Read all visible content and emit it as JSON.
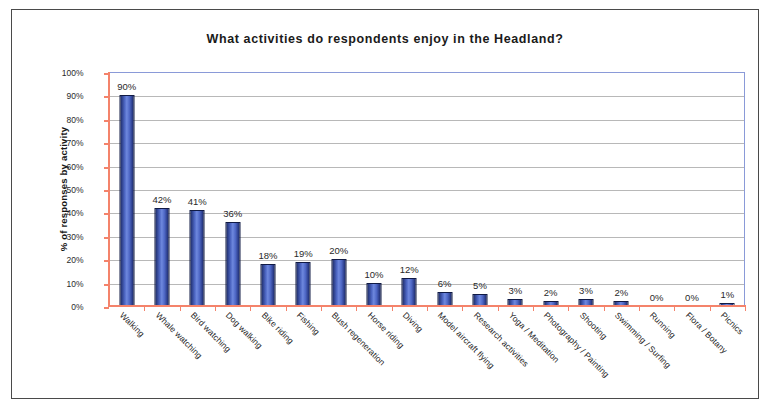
{
  "chart_data": {
    "type": "bar",
    "title": "What activities do respondents enjoy in the Headland?",
    "xlabel": "",
    "ylabel": "% of responses by activity",
    "ylim": [
      0,
      100
    ],
    "ytick_labels": [
      "100%",
      "90%",
      "80%",
      "70%",
      "60%",
      "50%",
      "40%",
      "30%",
      "20%",
      "10%",
      "0%"
    ],
    "ytick_values": [
      100,
      90,
      80,
      70,
      60,
      50,
      40,
      30,
      20,
      10,
      0
    ],
    "grid": true,
    "legend": null,
    "categories": [
      "Walking",
      "Whale watching",
      "Bird watching",
      "Dog walking",
      "Bike riding",
      "Fishing",
      "Bush regeneration",
      "Horse riding",
      "Diving",
      "Model aircraft flying",
      "Research activities",
      "Yoga / Meditation",
      "Photography / Painting",
      "Shooting",
      "Swimming / Surfing",
      "Running",
      "Flora / Botany",
      "Picnics"
    ],
    "values": [
      90,
      42,
      41,
      36,
      18,
      19,
      20,
      10,
      12,
      6,
      5,
      3,
      2,
      3,
      2,
      0,
      0,
      1
    ],
    "data_labels": [
      "90%",
      "42%",
      "41%",
      "36%",
      "18%",
      "19%",
      "20%",
      "10%",
      "12%",
      "6%",
      "5%",
      "3%",
      "2%",
      "3%",
      "2%",
      "0%",
      "0%",
      "1%"
    ],
    "colors": {
      "bar_dark": "#1f2f6e",
      "bar_light": "#6e88de",
      "axis": "#f4836b",
      "plot_border": "#8a9ad8",
      "gridline": "#b8b8b8",
      "frame": "#4a4a4a",
      "background": "#ffffff"
    }
  }
}
